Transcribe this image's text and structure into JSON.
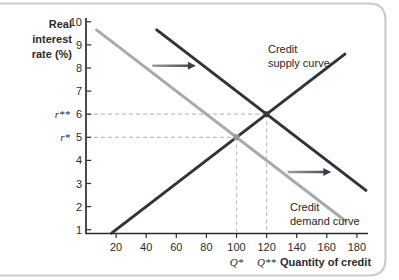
{
  "figure": {
    "ylabel_lines": [
      "Real",
      "interest",
      "rate (%)"
    ],
    "xlabel": "Quantity of credit"
  },
  "chart_data": {
    "type": "line",
    "xlabel": "Quantity of credit",
    "ylabel": "Real interest rate (%)",
    "x_ticks": [
      20,
      40,
      60,
      80,
      100,
      120,
      140,
      160,
      180
    ],
    "y_ticks": [
      1,
      2,
      3,
      4,
      5,
      6,
      7,
      8,
      9,
      10
    ],
    "xlim": [
      0,
      188
    ],
    "ylim": [
      0.8,
      10.2
    ],
    "grid": false,
    "series": [
      {
        "name": "Credit supply curve",
        "color": "#2f343b",
        "points": [
          [
            17,
            0.85
          ],
          [
            172,
            8.6
          ]
        ]
      },
      {
        "name": "Credit demand curve",
        "color": "#a7a9ac",
        "points": [
          [
            7,
            9.65
          ],
          [
            172,
            1.4
          ]
        ]
      },
      {
        "name": "Credit demand curve (shifted right)",
        "color": "#2f343b",
        "points": [
          [
            47,
            9.65
          ],
          [
            186,
            2.7
          ]
        ]
      }
    ],
    "equilibria": [
      {
        "q": 100,
        "r": 5,
        "q_label": "Q*",
        "r_label": "r*",
        "dot_color": "#939598"
      },
      {
        "q": 120,
        "r": 6,
        "q_label": "Q**",
        "r_label": "r**",
        "dot_color": "#33383f"
      }
    ],
    "shift_arrows": [
      {
        "from_q": 44,
        "to_q": 73,
        "r": 8.1
      },
      {
        "from_q": 134,
        "to_q": 163,
        "r": 3.5
      }
    ],
    "curve_labels": {
      "supply": [
        "Credit",
        "supply curve"
      ],
      "demand": [
        "Credit",
        "demand curve"
      ]
    },
    "colors": {
      "dark_curve": "#2f343b",
      "gray_curve": "#a7a9ac",
      "dashed_guide": "#bdbfc1",
      "axis": "#2c2c2c",
      "card_border": "#c9cacc"
    }
  }
}
